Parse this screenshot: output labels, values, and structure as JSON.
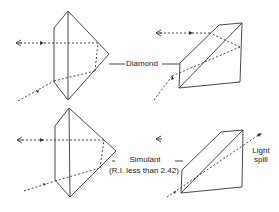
{
  "figure": {
    "labels": {
      "diamond": "Diamond",
      "simulant": "Simulant",
      "simulant_note": "(R.I. less than 2.42)",
      "light_spill_1": "Light",
      "light_spill_2": "spill"
    },
    "panels": [
      {
        "id": "diamond-side",
        "description": "Diamond viewed from side: light ray enters pavilion, totally reflects, exits toward eye"
      },
      {
        "id": "diamond-angled",
        "description": "Diamond viewed at angle: light reflected back toward eye"
      },
      {
        "id": "simulant-side",
        "description": "Simulant viewed from side: light ray reflects back toward eye"
      },
      {
        "id": "simulant-angled",
        "description": "Simulant viewed at angle: light leaks out of pavilion (light spill)"
      }
    ],
    "colors": {
      "line": "#333333",
      "background": "#ffffff"
    }
  }
}
